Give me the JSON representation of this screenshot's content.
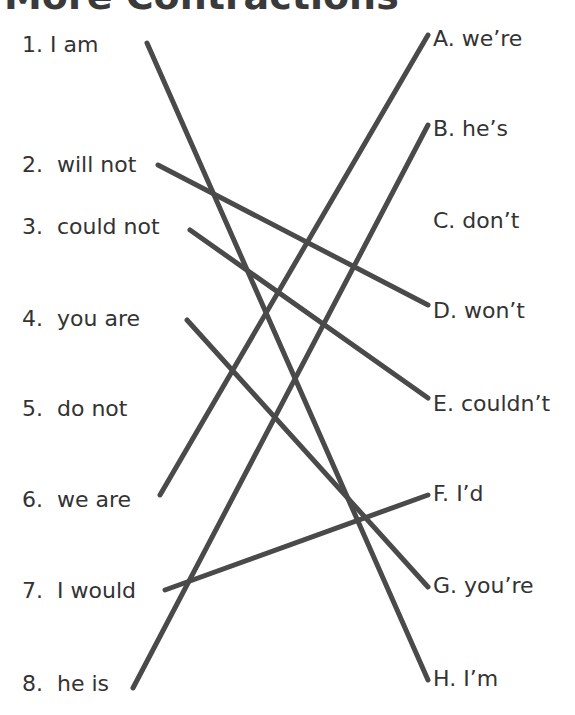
{
  "title": "More Contractions",
  "left_items": [
    {
      "num": "1.",
      "text": "I am"
    },
    {
      "num": "2.",
      "text": "will not"
    },
    {
      "num": "3.",
      "text": "could not"
    },
    {
      "num": "4.",
      "text": "you are"
    },
    {
      "num": "5.",
      "text": "do not"
    },
    {
      "num": "6.",
      "text": "we are"
    },
    {
      "num": "7.",
      "text": "I would"
    },
    {
      "num": "8.",
      "text": "he is"
    }
  ],
  "right_items": [
    {
      "letter": "A.",
      "text": "we’re"
    },
    {
      "letter": "B.",
      "text": "he’s"
    },
    {
      "letter": "C.",
      "text": "don’t"
    },
    {
      "letter": "D.",
      "text": "won’t"
    },
    {
      "letter": "E.",
      "text": "couldn’t"
    },
    {
      "letter": "F.",
      "text": "I’d"
    },
    {
      "letter": "G.",
      "text": "you’re"
    },
    {
      "letter": "H.",
      "text": "I’m"
    }
  ],
  "matches": [
    {
      "from": "1",
      "to": "H"
    },
    {
      "from": "2",
      "to": "D"
    },
    {
      "from": "3",
      "to": "E"
    },
    {
      "from": "4",
      "to": "G"
    },
    {
      "from": "6",
      "to": "A"
    },
    {
      "from": "7",
      "to": "F"
    },
    {
      "from": "8",
      "to": "B"
    }
  ],
  "line_color": "#4a4a4a"
}
